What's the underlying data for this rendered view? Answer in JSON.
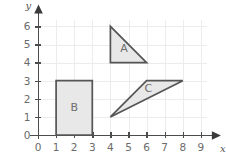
{
  "chart_data": {
    "type": "scatter",
    "title": "",
    "xlabel": "x",
    "ylabel": "y",
    "xlim": [
      0,
      9
    ],
    "ylim": [
      0,
      6
    ],
    "grid": true,
    "legend": "none",
    "x_ticks": [
      "0",
      "1",
      "2",
      "3",
      "4",
      "5",
      "6",
      "7",
      "8",
      "9"
    ],
    "y_ticks": [
      "0",
      "1",
      "2",
      "3",
      "4",
      "5",
      "6"
    ],
    "x_tick_values": [
      0,
      1,
      2,
      3,
      4,
      5,
      6,
      7,
      8,
      9
    ],
    "y_tick_values": [
      0,
      1,
      2,
      3,
      4,
      5,
      6
    ],
    "shapes": [
      {
        "label": "A",
        "kind": "right-triangle",
        "vertices": [
          [
            4,
            6
          ],
          [
            4,
            4
          ],
          [
            6,
            4
          ]
        ],
        "label_position": [
          4.75,
          4.75
        ],
        "fill": "#e8e8e8",
        "stroke": "#555557"
      },
      {
        "label": "B",
        "kind": "rectangle",
        "vertices": [
          [
            1,
            3
          ],
          [
            3,
            3
          ],
          [
            3,
            0
          ],
          [
            1,
            0
          ]
        ],
        "label_position": [
          2,
          1.5
        ],
        "fill": "#e8e8e8",
        "stroke": "#555557"
      },
      {
        "label": "C",
        "kind": "triangle",
        "vertices": [
          [
            4,
            1
          ],
          [
            6,
            3
          ],
          [
            8,
            3
          ]
        ],
        "label_position": [
          6.1,
          2.55
        ],
        "fill": "#e8e8e8",
        "stroke": "#555557"
      }
    ],
    "colors": {
      "background": "#ffffff",
      "grid": "#ececed",
      "axis": "#4c4c4c",
      "tick_label": "#6b6b6b",
      "shape_fill": "#e8e8e8",
      "shape_stroke": "#555557",
      "shape_label": "#6d6d6d"
    }
  }
}
